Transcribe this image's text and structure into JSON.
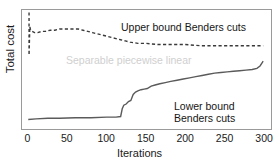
{
  "figure": {
    "cropped_caption_remnant": "number of customers.",
    "ylabel": "Total cost",
    "xlabel": "Iterations"
  },
  "annotations": {
    "upper": "Upper bound Benders cuts",
    "lower_line1": "Lower bound",
    "lower_line2": "Benders cuts",
    "separable": "Separable piecewise linear"
  },
  "colors": {
    "axis": "#9a9a9a",
    "upper_series": "#3a3a3a",
    "lower_series": "#5a5a5a",
    "faded_text": "#cfcfcf",
    "text": "#1a1a1a"
  },
  "ticks": {
    "x": [
      "0",
      "50",
      "100",
      "150",
      "200",
      "250",
      "300"
    ]
  },
  "chart_data": {
    "type": "line",
    "title": "",
    "xlabel": "Iterations",
    "ylabel": "Total cost",
    "xlim": [
      -8,
      310
    ],
    "ylim": [
      0,
      100
    ],
    "grid": false,
    "legend": "annotations on plot",
    "yticks_shown": false,
    "xticks": [
      0,
      50,
      100,
      150,
      200,
      250,
      300
    ],
    "series": [
      {
        "name": "Upper bound Benders cuts",
        "style": "dashed",
        "color": "#3a3a3a",
        "x": [
          1,
          1,
          2,
          3,
          5,
          8,
          12,
          17,
          22,
          28,
          34,
          40,
          46,
          52,
          58,
          64,
          70,
          76,
          82,
          88,
          94,
          100,
          106,
          112,
          118,
          124,
          130,
          140,
          150,
          165,
          180,
          200,
          220,
          240,
          260,
          280,
          300
        ],
        "y": [
          98,
          62,
          86,
          83,
          82,
          81,
          81,
          82,
          82,
          83,
          83,
          84,
          84,
          84,
          84,
          84,
          83,
          82,
          81,
          80,
          79,
          78,
          77,
          76,
          75,
          74,
          73,
          72,
          72,
          71,
          71,
          71,
          70,
          70,
          70,
          70,
          70
        ]
      },
      {
        "name": "Lower bound Benders cuts",
        "style": "solid",
        "color": "#5a5a5a",
        "x": [
          0,
          10,
          25,
          40,
          60,
          80,
          100,
          112,
          118,
          120,
          122,
          125,
          128,
          131,
          134,
          137,
          140,
          144,
          148,
          152,
          157,
          162,
          168,
          175,
          182,
          190,
          198,
          206,
          214,
          222,
          230,
          238,
          246,
          254,
          262,
          270,
          278,
          286,
          292,
          296,
          299,
          300
        ],
        "y": [
          8,
          8.5,
          9,
          9,
          9.5,
          9.5,
          10,
          10,
          10.5,
          17,
          20,
          21,
          23,
          24,
          29,
          31,
          32,
          33,
          33.5,
          34,
          36,
          37,
          38,
          39,
          40,
          41,
          42,
          43,
          44,
          45,
          46,
          47,
          47.5,
          48,
          48.5,
          49,
          49.5,
          50,
          51,
          53,
          56,
          57
        ]
      }
    ]
  }
}
